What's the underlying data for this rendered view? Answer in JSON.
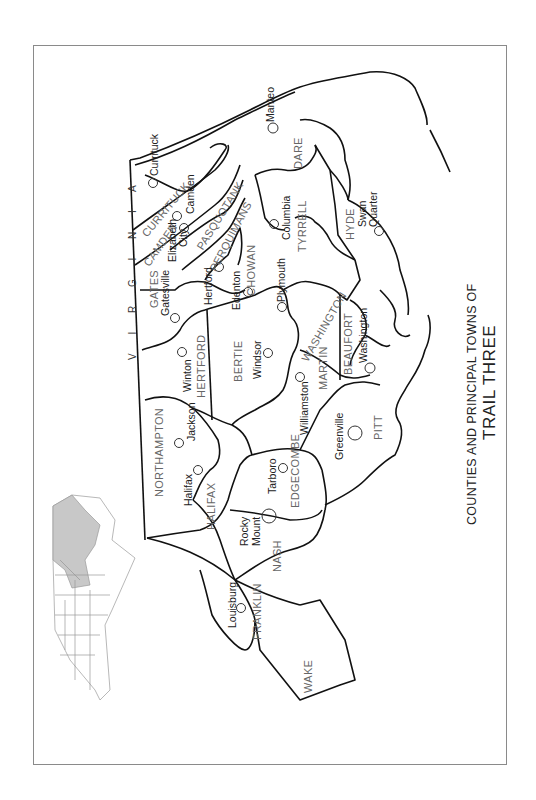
{
  "map": {
    "title_line1": "COUNTIES AND PRINCIPAL TOWNS OF",
    "title_line2": "TRAIL THREE",
    "state_border_label": "V I R G I N I A",
    "orientation": "rotated -90 degrees",
    "colors": {
      "border": "#111111",
      "frame": "#8a8a8a",
      "county_label": "#666666",
      "town_label": "#222222",
      "inset_highlight": "#c8c8c8",
      "inset_lines": "#9a9a9a"
    },
    "counties": [
      {
        "name": "CURRITUCK"
      },
      {
        "name": "CAMDEN"
      },
      {
        "name": "PASQUOTANK"
      },
      {
        "name": "PERQUIMANS"
      },
      {
        "name": "CHOWAN"
      },
      {
        "name": "GATES"
      },
      {
        "name": "HERTFORD"
      },
      {
        "name": "BERTIE"
      },
      {
        "name": "NORTHAMPTON"
      },
      {
        "name": "HALIFAX"
      },
      {
        "name": "EDGECOMBE"
      },
      {
        "name": "MARTIN"
      },
      {
        "name": "WASHINGTON"
      },
      {
        "name": "TYRRELL"
      },
      {
        "name": "DARE"
      },
      {
        "name": "HYDE"
      },
      {
        "name": "BEAUFORT"
      },
      {
        "name": "PITT"
      },
      {
        "name": "NASH"
      },
      {
        "name": "FRANKLIN"
      },
      {
        "name": "WAKE"
      }
    ],
    "towns": [
      {
        "name": "Currituck"
      },
      {
        "name": "Camden"
      },
      {
        "name": "Elizabeth City"
      },
      {
        "name": "Hertford"
      },
      {
        "name": "Edenton"
      },
      {
        "name": "Gatesville"
      },
      {
        "name": "Winton"
      },
      {
        "name": "Windsor"
      },
      {
        "name": "Jackson"
      },
      {
        "name": "Halifax"
      },
      {
        "name": "Tarboro"
      },
      {
        "name": "Rocky Mount"
      },
      {
        "name": "Williamston"
      },
      {
        "name": "Plymouth"
      },
      {
        "name": "Columbia"
      },
      {
        "name": "Manteo"
      },
      {
        "name": "Swan Quarter"
      },
      {
        "name": "Washington"
      },
      {
        "name": "Greenville"
      },
      {
        "name": "Louisburg"
      }
    ],
    "labels": {
      "elizabeth_1": "Elizabeth",
      "elizabeth_2": "City",
      "rocky_1": "Rocky",
      "rocky_2": "Mount",
      "swan_1": "Swan",
      "swan_2": "Quarter"
    },
    "inset": {
      "description": "North Carolina locator map with Trail Three counties shaded"
    }
  }
}
